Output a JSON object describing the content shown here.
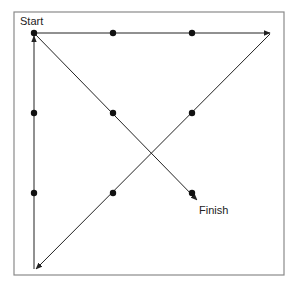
{
  "diagram": {
    "labels": {
      "start": "Start",
      "finish": "Finish"
    },
    "colors": {
      "frame": "#8a8a8a",
      "line": "#222222",
      "dot": "#111111",
      "background": "#ffffff"
    },
    "frame": {
      "x": 14,
      "y": 12,
      "width": 270,
      "height": 263
    },
    "dots": [
      {
        "row": 1,
        "col": 1,
        "x": 34,
        "y": 33
      },
      {
        "row": 1,
        "col": 2,
        "x": 113,
        "y": 33
      },
      {
        "row": 1,
        "col": 3,
        "x": 192,
        "y": 33
      },
      {
        "row": 2,
        "col": 1,
        "x": 34,
        "y": 113
      },
      {
        "row": 2,
        "col": 2,
        "x": 113,
        "y": 113
      },
      {
        "row": 2,
        "col": 3,
        "x": 192,
        "y": 113
      },
      {
        "row": 3,
        "col": 1,
        "x": 34,
        "y": 193
      },
      {
        "row": 3,
        "col": 2,
        "x": 113,
        "y": 193
      },
      {
        "row": 3,
        "col": 3,
        "x": 192,
        "y": 193
      }
    ],
    "path": [
      {
        "step": 1,
        "from": [
          34,
          33
        ],
        "to": [
          270,
          33
        ],
        "description": "Start across the top row past the grid"
      },
      {
        "step": 2,
        "from": [
          270,
          33
        ],
        "to": [
          36,
          269
        ],
        "description": "Diagonal down-left through middle-right and bottom-middle"
      },
      {
        "step": 3,
        "from": [
          34,
          269
        ],
        "to": [
          34,
          36
        ],
        "description": "Up the left column back to Start"
      },
      {
        "step": 4,
        "from": [
          34,
          33
        ],
        "to": [
          197,
          200
        ],
        "description": "Diagonal down-right through center to Finish"
      }
    ]
  }
}
